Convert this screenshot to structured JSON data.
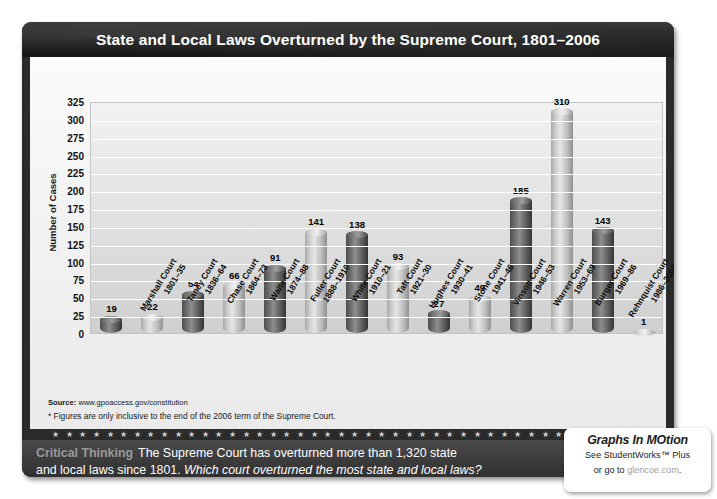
{
  "header": {
    "title": "State and Local Laws Overturned by the Supreme Court, 1801–2006"
  },
  "chart_data": {
    "type": "bar",
    "title": "State and Local Laws Overturned by the Supreme Court, 1801–2006",
    "xlabel": "",
    "ylabel": "Number of Cases",
    "ylim": [
      0,
      325
    ],
    "ytick_step": 25,
    "grid": true,
    "legend": "none",
    "yticks": [
      "325",
      "300",
      "275",
      "250",
      "225",
      "200",
      "175",
      "150",
      "125",
      "100",
      "75",
      "50",
      "25",
      "0"
    ],
    "categories": [
      "Marshall Court 1801–35",
      "Taney Court 1836–64",
      "Chase Court 1864–73",
      "Waite Court 1874–88",
      "Fuller Court 1888–1910",
      "White Court 1910–21",
      "Taft Court 1921–30",
      "Hughes Court 1930–41",
      "Stone Court 1941–46",
      "Vinson Court 1946–53",
      "Warren Court 1953–69",
      "Burger Court 1969–86",
      "Rehnquist Court 1986–2005",
      "Roberts Court 2005–*"
    ],
    "category_lines": [
      [
        "Marshall Court",
        "1801–35"
      ],
      [
        "Taney Court",
        "1836–64"
      ],
      [
        "Chase Court",
        "1864–73"
      ],
      [
        "Waite Court",
        "1874–88"
      ],
      [
        "Fuller Court",
        "1888–1910"
      ],
      [
        "White Court",
        "1910–21"
      ],
      [
        "Taft Court",
        "1921–30"
      ],
      [
        "Hughes Court",
        "1930–41"
      ],
      [
        "Stone Court",
        "1941–46"
      ],
      [
        "Vinson Court",
        "1946–53"
      ],
      [
        "Warren Court",
        "1953–69"
      ],
      [
        "Burger Court",
        "1969–86"
      ],
      [
        "Rehnquist Court",
        "1986–2005"
      ],
      [
        "Roberts Court",
        "2005–*"
      ]
    ],
    "values": [
      19,
      22,
      54,
      66,
      91,
      141,
      138,
      93,
      27,
      49,
      185,
      310,
      143,
      1
    ],
    "bar_shades": [
      "dark",
      "light",
      "dark",
      "light",
      "dark",
      "light",
      "dark",
      "light",
      "dark",
      "light",
      "dark",
      "light",
      "dark",
      "light"
    ],
    "colors": {
      "bar_dark": "#6e6e6e",
      "bar_light": "#cfcfcf",
      "plot_background": "#e3e3e3",
      "gridline": "#ffffff",
      "panel": "#2b2b2b",
      "band_heading": "#9a9a9a"
    }
  },
  "footnotes": {
    "source_label": "Source:",
    "source_value": "www.gpoaccess.gov/constitution",
    "note": "* Figures are only inclusive to the end of the 2006 term of the Supreme Court."
  },
  "critical_thinking": {
    "heading": "Critical Thinking",
    "line1_rest": "The Supreme Court has overturned more than 1,320 state",
    "line2_plain": "and local laws since 1801.",
    "line2_question": "Which court overturned the most state and local laws?"
  },
  "badge": {
    "title": "Graphs In MOtion",
    "line1": "See StudentWorks™ Plus",
    "line2_prefix": "or go to ",
    "link": "glencoe.com",
    "line2_suffix": "."
  },
  "divider": {
    "star_glyph": "★",
    "star_count": 44
  }
}
